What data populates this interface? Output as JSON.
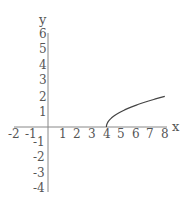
{
  "chart_data": {
    "type": "line",
    "title": "",
    "xlabel": "x",
    "ylabel": "y",
    "xlim": [
      -2.5,
      8.1
    ],
    "ylim": [
      -4.2,
      6.2
    ],
    "grid": false,
    "legend": null,
    "x_ticks": [
      -2,
      -1,
      1,
      2,
      3,
      4,
      5,
      6,
      7,
      8
    ],
    "y_ticks": [
      -4,
      -3,
      -2,
      -1,
      1,
      2,
      3,
      4,
      5,
      6
    ],
    "series": [
      {
        "name": "y = sqrt(x - 4)",
        "x": [
          4,
          4.1,
          4.25,
          4.5,
          5,
          5.5,
          6,
          6.5,
          7,
          7.5,
          8
        ],
        "values": [
          0,
          0.32,
          0.5,
          0.71,
          1,
          1.22,
          1.41,
          1.58,
          1.73,
          1.87,
          2
        ]
      }
    ]
  },
  "axes": {
    "x_label": "x",
    "y_label": "y",
    "x_tick_labels": [
      "-2",
      "-1",
      "1",
      "2",
      "3",
      "4",
      "5",
      "6",
      "7",
      "8"
    ],
    "y_tick_labels": [
      "6",
      "5",
      "4",
      "3",
      "2",
      "1",
      "-1",
      "-2",
      "-3",
      "-4"
    ]
  },
  "colors": {
    "axis": "#888888",
    "curve": "#444444",
    "text": "#555555"
  }
}
